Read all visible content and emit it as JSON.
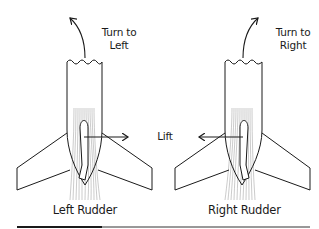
{
  "diagram": {
    "left_panel": {
      "direction_label_line1": "Turn to",
      "direction_label_line2": "Left",
      "caption": "Left Rudder",
      "lift_arrow_direction": "right"
    },
    "right_panel": {
      "direction_label_line1": "Turn to",
      "direction_label_line2": "Right",
      "caption": "Right Rudder",
      "lift_arrow_direction": "left"
    },
    "center_label": "Lift",
    "colors": {
      "stroke": "#1a1a1a",
      "streamline": "#8a8a8a",
      "background": "#ffffff"
    }
  }
}
